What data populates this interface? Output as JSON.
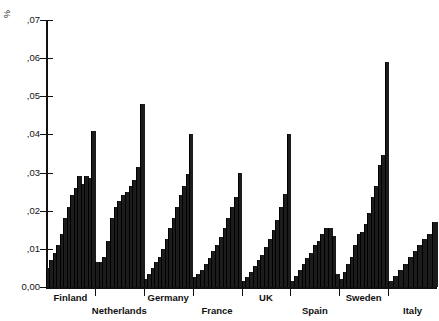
{
  "chart_data": {
    "type": "bar",
    "title": "",
    "subtitle": "",
    "xlabel": "",
    "ylabel": "%",
    "ylim": [
      0.0,
      0.07
    ],
    "ytick_labels": [
      "0,00",
      ",01",
      ",02",
      ",03",
      ",04",
      ",05",
      ",06",
      ",07"
    ],
    "ytick_values": [
      0.0,
      0.01,
      0.02,
      0.03,
      0.04,
      0.05,
      0.06,
      0.07
    ],
    "grid": false,
    "legend": null,
    "categories": [
      "Finland",
      "Netherlands",
      "Germany",
      "France",
      "UK",
      "Spain",
      "Sweden",
      "Italy"
    ],
    "note": "Eight country groups; within each group a rising staircase of narrow bars terminating in a tall thin spike.",
    "groups": [
      {
        "name": "Finland",
        "values": [
          0.005,
          0.007,
          0.009,
          0.011,
          0.014,
          0.018,
          0.021,
          0.024,
          0.026,
          0.029,
          0.027,
          0.029,
          0.0285,
          0.041
        ]
      },
      {
        "name": "Netherlands",
        "values": [
          0.0065,
          0.0065,
          0.008,
          0.012,
          0.018,
          0.021,
          0.0225,
          0.024,
          0.025,
          0.0265,
          0.028,
          0.0315,
          0.048
        ]
      },
      {
        "name": "Germany",
        "values": [
          0.002,
          0.0035,
          0.005,
          0.0065,
          0.008,
          0.01,
          0.0125,
          0.0155,
          0.018,
          0.021,
          0.024,
          0.0265,
          0.0295,
          0.04
        ]
      },
      {
        "name": "France",
        "values": [
          0.0025,
          0.0035,
          0.0045,
          0.006,
          0.0075,
          0.0095,
          0.011,
          0.013,
          0.0155,
          0.018,
          0.021,
          0.0235,
          0.03
        ]
      },
      {
        "name": "UK",
        "values": [
          0.0015,
          0.0025,
          0.004,
          0.0055,
          0.007,
          0.0085,
          0.0105,
          0.0125,
          0.015,
          0.0175,
          0.021,
          0.0245,
          0.04
        ]
      },
      {
        "name": "Spain",
        "values": [
          0.0015,
          0.003,
          0.0045,
          0.006,
          0.0075,
          0.009,
          0.011,
          0.012,
          0.014,
          0.0155,
          0.0155,
          0.0135,
          0.0035
        ]
      },
      {
        "name": "Sweden",
        "values": [
          0.002,
          0.004,
          0.006,
          0.008,
          0.011,
          0.014,
          0.0145,
          0.0165,
          0.0195,
          0.0235,
          0.0265,
          0.032,
          0.0345,
          0.059
        ]
      },
      {
        "name": "Italy",
        "values": [
          0.0015,
          0.003,
          0.0045,
          0.006,
          0.008,
          0.0095,
          0.011,
          0.0125,
          0.014,
          0.017
        ]
      }
    ]
  },
  "axis": {
    "y_title": "%"
  }
}
